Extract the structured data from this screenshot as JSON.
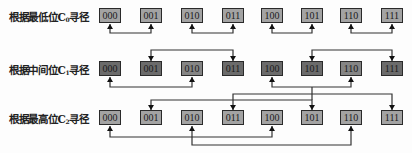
{
  "rows": [
    {
      "label_prefix": "根据最低位C",
      "label_sub": "0",
      "label_suffix": "寻径",
      "bit": "C0",
      "nodes": [
        {
          "id": "000",
          "shade": "light"
        },
        {
          "id": "001",
          "shade": "light"
        },
        {
          "id": "010",
          "shade": "light"
        },
        {
          "id": "011",
          "shade": "light"
        },
        {
          "id": "100",
          "shade": "light"
        },
        {
          "id": "101",
          "shade": "light"
        },
        {
          "id": "110",
          "shade": "light"
        },
        {
          "id": "111",
          "shade": "light"
        }
      ],
      "connections": [
        [
          "000",
          "001"
        ],
        [
          "010",
          "011"
        ],
        [
          "100",
          "101"
        ],
        [
          "110",
          "111"
        ]
      ]
    },
    {
      "label_prefix": "根据中间位C",
      "label_sub": "1",
      "label_suffix": "寻径",
      "bit": "C1",
      "nodes": [
        {
          "id": "000",
          "shade": "dark"
        },
        {
          "id": "001",
          "shade": "dark"
        },
        {
          "id": "010",
          "shade": "mid"
        },
        {
          "id": "011",
          "shade": "dark"
        },
        {
          "id": "100",
          "shade": "dark"
        },
        {
          "id": "101",
          "shade": "dark"
        },
        {
          "id": "110",
          "shade": "mid"
        },
        {
          "id": "111",
          "shade": "dark"
        }
      ],
      "connections": [
        [
          "000",
          "010"
        ],
        [
          "001",
          "011"
        ],
        [
          "100",
          "110"
        ],
        [
          "101",
          "111"
        ]
      ]
    },
    {
      "label_prefix": "根据最高位C",
      "label_sub": "2",
      "label_suffix": "寻径",
      "bit": "C2",
      "nodes": [
        {
          "id": "000",
          "shade": "light"
        },
        {
          "id": "001",
          "shade": "light"
        },
        {
          "id": "010",
          "shade": "light"
        },
        {
          "id": "011",
          "shade": "light"
        },
        {
          "id": "100",
          "shade": "light"
        },
        {
          "id": "101",
          "shade": "light"
        },
        {
          "id": "110",
          "shade": "light"
        },
        {
          "id": "111",
          "shade": "light"
        }
      ],
      "connections": [
        [
          "000",
          "100"
        ],
        [
          "001",
          "101"
        ],
        [
          "010",
          "110"
        ],
        [
          "011",
          "111"
        ]
      ]
    }
  ]
}
